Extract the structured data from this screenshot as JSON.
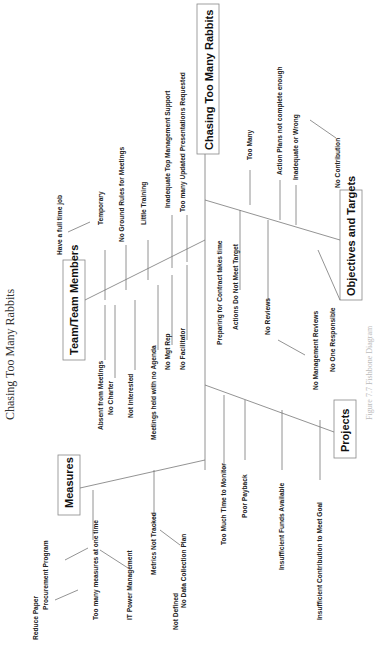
{
  "title": "Chasing Too Many Rabbits",
  "effect": "Chasing Too Many Rabbits",
  "categories": {
    "team": "Team/Team Members",
    "measures": "Measures",
    "projects": "Projects",
    "objectives": "Objectives and Targets"
  },
  "causes": {
    "team": {
      "full_time_job": "Have a full time job",
      "temporary": "Temporary",
      "no_ground_rules": "No Ground Rules for Meetings",
      "little_training": "Little Training",
      "inadequate_support": "Inadequate Top Management Support",
      "too_many_updates": "Too many Updated Presentations Requested",
      "absent": "Absent from Meetings",
      "no_charter": "No Charter",
      "not_interested": "Not Interested",
      "no_agenda": "Meetings held with no Agenda",
      "no_mgt_rep": "No Mgt Rep",
      "no_facilitator": "No Facilitator"
    },
    "measures": {
      "reduce_paper": "Reduce Paper",
      "procurement": "Procurement Program",
      "too_many_measures": "Too many measures at one time",
      "it_power": "IT Power Management",
      "metrics_not_tracked": "Metrics Not Tracked",
      "not_defined": "Not Defined",
      "no_data_plan": "No Data Collection Plan"
    },
    "projects": {
      "too_much_time": "Too Much Time to Monitor",
      "poor_payback": "Poor Payback",
      "insufficient_funds": "Insufficient Funds Available",
      "insufficient_contribution": "Insufficient Contribution to Meet Goal"
    },
    "objectives": {
      "too_many": "Too Many",
      "action_plans": "Action Plans not complete enough",
      "inadequate": "Inadequate or Wrong",
      "no_contribution": "No Contribution",
      "preparing": "Preparing for Contract takes time",
      "not_meet_target": "Actions Do Not Meet Target",
      "no_reviews": "No Reviews",
      "no_mgmt_reviews": "No Management Reviews",
      "no_one_responsible": "No One Responsible"
    }
  },
  "caption": "Figure 7.7 Fishbone Diagram"
}
